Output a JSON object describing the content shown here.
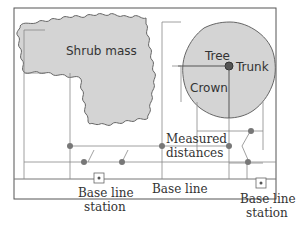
{
  "labels": {
    "shrub": "Shrub mass",
    "tree": "Tree",
    "trunk": "Trunk",
    "crown": "Crown",
    "measured1": "Measured",
    "measured2": "distances",
    "baseline": "Base line",
    "station_left1": "Base line",
    "station_left2": "station",
    "station_right1": "Base line",
    "station_right2": "station"
  },
  "colors": {
    "fill": "#d4d4d4",
    "stroke": "#666666",
    "line": "#888888",
    "dot": "#777777",
    "frame": "#555555"
  }
}
